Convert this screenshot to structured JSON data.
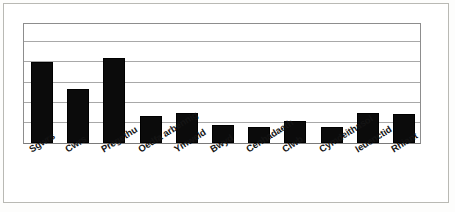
{
  "chart_data": {
    "type": "bar",
    "title": "",
    "subtitle": "",
    "xlabel": "",
    "ylabel": "",
    "categories": [
      "Sgwrs",
      "Cwrs",
      "Pregethu",
      "Oedfa arbennig",
      "Ymweld",
      "Bwyd",
      "Cenhadaeth",
      "Clwb",
      "Cymdeithasol",
      "Ieuenctid",
      "Rhiant"
    ],
    "values": [
      4.0,
      2.7,
      4.2,
      1.35,
      1.5,
      0.9,
      0.8,
      1.1,
      0.8,
      1.5,
      1.45
    ],
    "ylim": [
      0,
      6
    ],
    "gridlines": [
      1,
      2,
      3,
      4,
      5,
      6
    ],
    "grid": true,
    "y_tick_labels": [],
    "x_tick_labels_rotated": true,
    "legend": [],
    "legend_position": "none",
    "bar_color": "#0b0b0b",
    "grid_color": "#a8a8a8",
    "axis_color": "#8d8d8d",
    "background_color": "#ffffff",
    "annotations": []
  },
  "figure": {
    "frame_border_color": "#b9b9b4",
    "canvas_background": "#fdfdfc"
  }
}
